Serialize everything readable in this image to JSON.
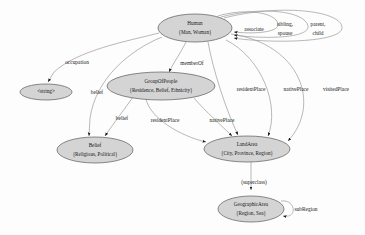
{
  "diagram": {
    "type": "directed-graph",
    "style": {
      "node_fill": "#d4d4d4",
      "node_stroke": "#5a5a5a",
      "edge_stroke": "#9a9a9a",
      "background": "#fdfdfd",
      "text_color": "#1a1a1a"
    },
    "nodes": [
      {
        "id": "human",
        "name": "Human",
        "attributes": "{Man, Woman}",
        "cx": 195,
        "cy": 28,
        "rx": 37,
        "ry": 14
      },
      {
        "id": "string",
        "name": "<string>",
        "attributes": "",
        "cx": 46,
        "cy": 92,
        "rx": 26,
        "ry": 8
      },
      {
        "id": "groupofpeople",
        "name": "GroupOfPeople",
        "attributes": "{Residence, Belief, Ethnicity}",
        "cx": 161,
        "cy": 86,
        "rx": 54,
        "ry": 14
      },
      {
        "id": "belief",
        "name": "Belief",
        "attributes": "{Religious, Political}",
        "cx": 95,
        "cy": 150,
        "rx": 38,
        "ry": 13
      },
      {
        "id": "landarea",
        "name": "LandArea",
        "attributes": "{City, Province, Region}",
        "cx": 247,
        "cy": 149,
        "rx": 43,
        "ry": 13
      },
      {
        "id": "geographicarea",
        "name": "GeographicArea",
        "attributes": "{Region, Sea}",
        "cx": 251,
        "cy": 209,
        "rx": 33,
        "ry": 13
      }
    ],
    "edges": [
      {
        "id": "e-occupation",
        "from": "human",
        "to": "string",
        "label": "occupation",
        "label_x": 77,
        "label_y": 63
      },
      {
        "id": "e-memberof",
        "from": "human",
        "to": "groupofpeople",
        "label": "memberOf",
        "label_x": 192,
        "label_y": 64
      },
      {
        "id": "e-belief-human",
        "from": "human",
        "to": "belief",
        "label": "belief",
        "label_x": 97,
        "label_y": 93
      },
      {
        "id": "e-belief-group",
        "from": "groupofpeople",
        "to": "belief",
        "label": "belief",
        "label_x": 122,
        "label_y": 119
      },
      {
        "id": "e-resident-grp",
        "from": "groupofpeople",
        "to": "landarea",
        "label": "residentPlace",
        "label_x": 165,
        "label_y": 121
      },
      {
        "id": "e-native-grp",
        "from": "groupofpeople",
        "to": "landarea",
        "label": "nativePlace",
        "label_x": 222,
        "label_y": 121
      },
      {
        "id": "e-resident-hum",
        "from": "human",
        "to": "landarea",
        "label": "residentPlace",
        "label_x": 251,
        "label_y": 90
      },
      {
        "id": "e-native-hum",
        "from": "human",
        "to": "landarea",
        "label": "nativePlace",
        "label_x": 296,
        "label_y": 90
      },
      {
        "id": "e-visited-hum",
        "from": "human",
        "to": "landarea",
        "label": "visitedPlace",
        "label_x": 336,
        "label_y": 90
      },
      {
        "id": "e-associate",
        "from": "human",
        "to": "human",
        "label": "associate",
        "label_x": 254,
        "label_y": 30
      },
      {
        "id": "e-sibling",
        "from": "human",
        "to": "human",
        "label": "sibling,",
        "label_x": 285,
        "label_y": 25
      },
      {
        "id": "e-spouse",
        "from": "human",
        "to": "human",
        "label": "spouse",
        "label_x": 285,
        "label_y": 34
      },
      {
        "id": "e-parent",
        "from": "human",
        "to": "human",
        "label": "parent,",
        "label_x": 318,
        "label_y": 25
      },
      {
        "id": "e-child",
        "from": "human",
        "to": "human",
        "label": "child",
        "label_x": 318,
        "label_y": 34
      },
      {
        "id": "e-superclass",
        "from": "landarea",
        "to": "geographicarea",
        "label": "(superclass)",
        "label_x": 254,
        "label_y": 183
      },
      {
        "id": "e-subregion",
        "from": "geographicarea",
        "to": "geographicarea",
        "label": "subRegion",
        "label_x": 306,
        "label_y": 210
      }
    ]
  }
}
